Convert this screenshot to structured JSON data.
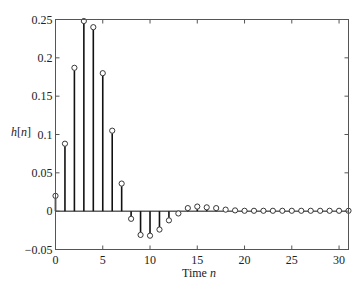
{
  "chart_data": {
    "type": "stem",
    "title": "",
    "xlabel": "Time n",
    "xlabel_parts": [
      {
        "text": "Time ",
        "italic": false
      },
      {
        "text": "n",
        "italic": true
      }
    ],
    "ylabel": "h[n]",
    "ylabel_parts": [
      {
        "text": "h",
        "italic": true
      },
      {
        "text": "[",
        "italic": false
      },
      {
        "text": "n",
        "italic": true
      },
      {
        "text": "]",
        "italic": false
      }
    ],
    "xlim": [
      0,
      31
    ],
    "ylim": [
      -0.05,
      0.25
    ],
    "xticks": [
      0,
      5,
      10,
      15,
      20,
      25,
      30
    ],
    "xtick_labels": [
      "0",
      "5",
      "10",
      "15",
      "20",
      "25",
      "30"
    ],
    "yticks": [
      -0.05,
      0,
      0.05,
      0.1,
      0.15,
      0.2,
      0.25
    ],
    "ytick_labels": [
      "−0.05",
      "0",
      "0.05",
      "0.1",
      "0.15",
      "0.2",
      "0.25"
    ],
    "grid": false,
    "legend": null,
    "marker": "open-circle",
    "x": [
      0,
      1,
      2,
      3,
      4,
      5,
      6,
      7,
      8,
      9,
      10,
      11,
      12,
      13,
      14,
      15,
      16,
      17,
      18,
      19,
      20,
      21,
      22,
      23,
      24,
      25,
      26,
      27,
      28,
      29,
      30,
      31
    ],
    "values": [
      0.02,
      0.088,
      0.187,
      0.248,
      0.24,
      0.18,
      0.105,
      0.036,
      -0.01,
      -0.031,
      -0.032,
      -0.024,
      -0.012,
      -0.003,
      0.004,
      0.006,
      0.005,
      0.004,
      0.002,
      0.001,
      0.0005,
      0.0005,
      0.0005,
      0.0005,
      0.0005,
      0.0005,
      0.0005,
      0.0005,
      0.0005,
      0.0005,
      0.0005,
      0.0005
    ]
  },
  "colors": {
    "stem": "#111111",
    "marker_edge": "#222222",
    "axis": "#555555",
    "background": "#ffffff"
  }
}
